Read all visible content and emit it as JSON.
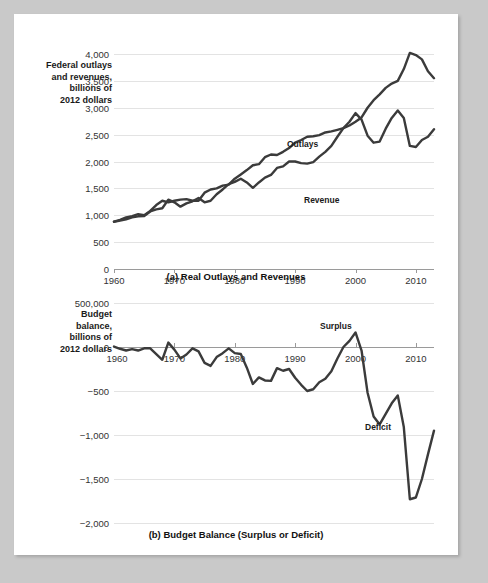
{
  "figure": {
    "background_color": "#ffffff",
    "page_border_color": "#c9c9c9",
    "line_color": "#3b3b3b"
  },
  "panel_a": {
    "axis_title": "Federal outlays\nand revenues,\nbillions of\n2012 dollars",
    "caption": "(a) Real Outlays and Revenues",
    "yticks": [
      "4,000",
      "3,500",
      "3,000",
      "2,500",
      "2,000",
      "1,500",
      "1,000",
      "500",
      "0"
    ],
    "xticks": [
      "1960",
      "1970",
      "1980",
      "1990",
      "2000",
      "2010"
    ],
    "label_outlays": "Outlays",
    "label_revenue": "Revenue"
  },
  "panel_b": {
    "axis_title": "Budget\nbalance,\nbillions of\n2012 dollars",
    "caption": "(b) Budget Balance (Surplus or Deficit)",
    "yticks": [
      "500,000",
      "0",
      "−500",
      "−1,000",
      "−1,500",
      "−2,000"
    ],
    "xticks": [
      "1960",
      "1970",
      "1980",
      "1990",
      "2000",
      "2010"
    ],
    "label_surplus": "Surplus",
    "label_deficit": "Deficit"
  },
  "chart_data": [
    {
      "type": "line",
      "title": "(a) Real Outlays and Revenues",
      "xlabel": "",
      "ylabel": "Federal outlays and revenues, billions of 2012 dollars",
      "xlim": [
        1960,
        2013
      ],
      "ylim": [
        0,
        4000
      ],
      "ytick_values": [
        0,
        500,
        1000,
        1500,
        2000,
        2500,
        3000,
        3500,
        4000
      ],
      "xtick_values": [
        1960,
        1970,
        1980,
        1990,
        2000,
        2010
      ],
      "grid": true,
      "legend": "inline-labels",
      "x": [
        1960,
        1961,
        1962,
        1963,
        1964,
        1965,
        1966,
        1967,
        1968,
        1969,
        1970,
        1971,
        1972,
        1973,
        1974,
        1975,
        1976,
        1977,
        1978,
        1979,
        1980,
        1981,
        1982,
        1983,
        1984,
        1985,
        1986,
        1987,
        1988,
        1989,
        1990,
        1991,
        1992,
        1993,
        1994,
        1995,
        1996,
        1997,
        1998,
        1999,
        2000,
        2001,
        2002,
        2003,
        2004,
        2005,
        2006,
        2007,
        2008,
        2009,
        2010,
        2011,
        2012,
        2013
      ],
      "series": [
        {
          "name": "Outlays",
          "values": [
            880,
            915,
            960,
            985,
            1020,
            1000,
            1080,
            1190,
            1270,
            1240,
            1270,
            1290,
            1300,
            1270,
            1270,
            1420,
            1480,
            1500,
            1550,
            1570,
            1680,
            1760,
            1840,
            1930,
            1950,
            2080,
            2130,
            2120,
            2180,
            2250,
            2350,
            2400,
            2460,
            2470,
            2490,
            2540,
            2560,
            2590,
            2620,
            2670,
            2740,
            2820,
            3000,
            3140,
            3250,
            3370,
            3450,
            3500,
            3720,
            4020,
            3980,
            3900,
            3680,
            3550
          ]
        },
        {
          "name": "Revenue",
          "values": [
            880,
            900,
            925,
            960,
            980,
            985,
            1070,
            1110,
            1130,
            1290,
            1240,
            1160,
            1220,
            1260,
            1320,
            1240,
            1270,
            1390,
            1480,
            1580,
            1620,
            1680,
            1610,
            1510,
            1610,
            1700,
            1750,
            1880,
            1910,
            2000,
            2000,
            1970,
            1960,
            1990,
            2090,
            2180,
            2290,
            2460,
            2620,
            2740,
            2900,
            2780,
            2480,
            2350,
            2370,
            2610,
            2810,
            2950,
            2810,
            2290,
            2270,
            2400,
            2460,
            2600
          ]
        }
      ]
    },
    {
      "type": "line",
      "title": "(b) Budget Balance (Surplus or Deficit)",
      "xlabel": "",
      "ylabel": "Budget balance, billions of 2012 dollars",
      "xlim": [
        1960,
        2013
      ],
      "ylim": [
        -2000,
        500
      ],
      "ytick_values": [
        500,
        0,
        -500,
        -1000,
        -1500,
        -2000
      ],
      "xtick_values": [
        1960,
        1970,
        1980,
        1990,
        2000,
        2010
      ],
      "grid": true,
      "annotations": [
        "Surplus",
        "Deficit"
      ],
      "x": [
        1960,
        1961,
        1962,
        1963,
        1964,
        1965,
        1966,
        1967,
        1968,
        1969,
        1970,
        1971,
        1972,
        1973,
        1974,
        1975,
        1976,
        1977,
        1978,
        1979,
        1980,
        1981,
        1982,
        1983,
        1984,
        1985,
        1986,
        1987,
        1988,
        1989,
        1990,
        1991,
        1992,
        1993,
        1994,
        1995,
        1996,
        1997,
        1998,
        1999,
        2000,
        2001,
        2002,
        2003,
        2004,
        2005,
        2006,
        2007,
        2008,
        2009,
        2010,
        2011,
        2012,
        2013
      ],
      "series": [
        {
          "name": "Budget balance",
          "values": [
            5,
            -20,
            -40,
            -25,
            -40,
            -15,
            -15,
            -80,
            -145,
            50,
            -30,
            -130,
            -85,
            -15,
            -50,
            -180,
            -215,
            -115,
            -70,
            -15,
            -70,
            -80,
            -235,
            -420,
            -345,
            -380,
            -385,
            -240,
            -270,
            -250,
            -350,
            -430,
            -500,
            -480,
            -400,
            -360,
            -275,
            -130,
            0,
            70,
            165,
            -40,
            -520,
            -790,
            -880,
            -760,
            -640,
            -550,
            -910,
            -1730,
            -1710,
            -1500,
            -1220,
            -950
          ]
        }
      ]
    }
  ]
}
